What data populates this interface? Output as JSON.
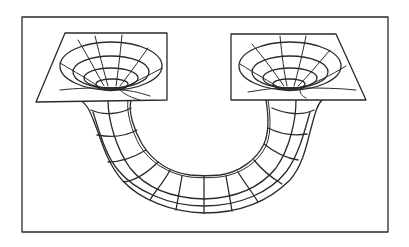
{
  "figure": {
    "subject": "Wormhole sketch: two funnel-shaped mouths in flat spacetime sheets connected by a curved tube",
    "colors": {
      "ink": "#2a2a2a",
      "background": "#ffffff"
    },
    "frame": {
      "x": 22,
      "y": 17,
      "width": 366,
      "height": 215
    },
    "left_mouth": {
      "plane": [
        [
          65,
          33
        ],
        [
          167,
          33
        ],
        [
          167,
          100
        ],
        [
          36,
          102
        ]
      ],
      "center": [
        101,
        86
      ]
    },
    "right_mouth": {
      "plane": [
        [
          231,
          34
        ],
        [
          336,
          34
        ],
        [
          366,
          100
        ],
        [
          231,
          100
        ]
      ],
      "center": [
        293,
        86
      ]
    },
    "tube": {
      "segments": 12,
      "shape": "U-shaped arc connecting both mouths beneath the planes"
    }
  }
}
